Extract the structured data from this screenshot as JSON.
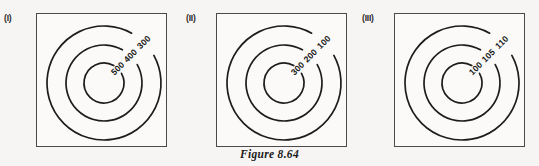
{
  "figure": {
    "caption": "Figure 8.64",
    "background_color": "#f6f5f3",
    "frame_color": "#4a4a4a",
    "contour_color": "#1d1d1d"
  },
  "panels": [
    {
      "tag": "(I)",
      "left": 36,
      "tag_left": 4,
      "contours": [
        {
          "label": "300",
          "radius": 57,
          "kind": "outer"
        },
        {
          "label": "400",
          "radius": 38,
          "kind": "middle"
        },
        {
          "label": "500",
          "radius": 20,
          "kind": "inner"
        }
      ]
    },
    {
      "tag": "(II)",
      "left": 216,
      "tag_left": 186,
      "contours": [
        {
          "label": "100",
          "radius": 57,
          "kind": "outer"
        },
        {
          "label": "200",
          "radius": 38,
          "kind": "middle"
        },
        {
          "label": "300",
          "radius": 20,
          "kind": "inner"
        }
      ]
    },
    {
      "tag": "(III)",
      "left": 394,
      "tag_left": 362,
      "contours": [
        {
          "label": "110",
          "radius": 57,
          "kind": "outer"
        },
        {
          "label": "105",
          "radius": 38,
          "kind": "middle"
        },
        {
          "label": "100",
          "radius": 20,
          "kind": "inner"
        }
      ]
    }
  ],
  "geometry": {
    "center_x": 68,
    "center_y": 70,
    "panel_width": 131,
    "panel_height": 134,
    "label_angle_deg": -45,
    "gap_half_deg": 16
  }
}
